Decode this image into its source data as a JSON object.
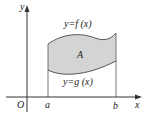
{
  "diagram": {
    "axes": {
      "x_label": "x",
      "y_label": "y",
      "origin_label": "O"
    },
    "bounds": {
      "left": "a",
      "right": "b"
    },
    "curves": {
      "upper": "y=f (x)",
      "lower": "y=g (x)"
    },
    "region_label": "A",
    "colors": {
      "region_fill": "#d4d4d4",
      "stroke": "#555555",
      "axis": "#333333"
    }
  }
}
